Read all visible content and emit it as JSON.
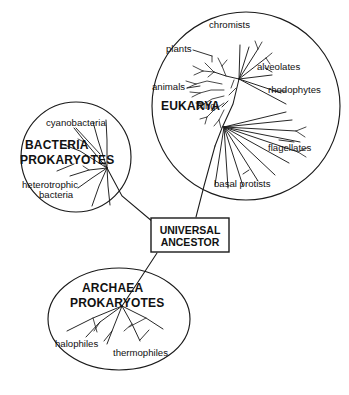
{
  "diagram": {
    "background_color": "#ffffff",
    "line_color": "#1a1a1a",
    "width": 349,
    "height": 395
  },
  "root_node": {
    "label_line1": "UNIVERSAL",
    "label_line2": "ANCESTOR",
    "box": {
      "x": 151,
      "y": 218,
      "width": 78,
      "height": 34
    }
  },
  "domains": [
    {
      "key": "bacteria",
      "name_line1": "BACTERIA",
      "name_line2": "PROKARYOTES",
      "shape": "circle",
      "center_x": 76,
      "center_y": 157,
      "radius_x": 54,
      "radius_y": 57,
      "groups": [
        {
          "label": "cyanobacteria"
        },
        {
          "label": "heterotrophic bacteria"
        }
      ]
    },
    {
      "key": "eukarya",
      "name_line1": "EUKARYA",
      "name_line2": "",
      "shape": "circle",
      "center_x": 246,
      "center_y": 106,
      "radius_x": 94,
      "radius_y": 94,
      "groups": [
        {
          "label": "chromists"
        },
        {
          "label": "plants"
        },
        {
          "label": "animals"
        },
        {
          "label": "fungi"
        },
        {
          "label": "alveolates"
        },
        {
          "label": "rhodophytes"
        },
        {
          "label": "flagellates"
        },
        {
          "label": "basal protists"
        }
      ]
    },
    {
      "key": "archaea",
      "name_line1": "ARCHAEA",
      "name_line2": "PROKARYOTES",
      "shape": "ellipse",
      "center_x": 119,
      "center_y": 319,
      "radius_x": 71,
      "radius_y": 51,
      "groups": [
        {
          "label": "halophiles"
        },
        {
          "label": "thermophiles"
        }
      ]
    }
  ],
  "labels": {
    "chromists": "chromists",
    "plants": "plants",
    "animals": "animals",
    "fungi": "fungi",
    "alveolates": "alveolates",
    "rhodophytes": "rhodophytes",
    "flagellates": "flagellates",
    "basal_protists": "basal protists",
    "eukarya": "EUKARYA",
    "cyanobacteria": "cyanobacteria",
    "heterotrophic_line1": "heterotrophic",
    "heterotrophic_line2": "bacteria",
    "bacteria": "BACTERIA",
    "bacteria_prokaryotes": "PROKARYOTES",
    "archaea": "ARCHAEA",
    "archaea_prokaryotes": "PROKARYOTES",
    "halophiles": "halophiles",
    "thermophiles": "thermophiles",
    "universal": "UNIVERSAL",
    "ancestor": "ANCESTOR"
  }
}
